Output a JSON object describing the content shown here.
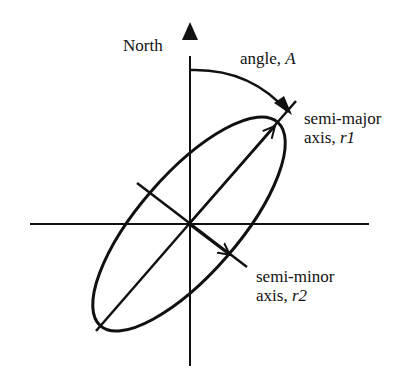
{
  "diagram": {
    "labels": {
      "north": "North",
      "angle_prefix": "angle, ",
      "angle_var": "A",
      "major_line1": "semi-major",
      "major_line2_prefix": "axis, ",
      "major_var": "r1",
      "minor_line1": "semi-minor",
      "minor_line2_prefix": "axis, ",
      "minor_var": "r2"
    },
    "geometry": {
      "center": [
        189,
        224
      ],
      "semi_major_px": 135,
      "semi_minor_px": 50,
      "rotation_deg_from_north": 41
    },
    "colors": {
      "stroke": "#111111",
      "background": "#ffffff"
    }
  }
}
